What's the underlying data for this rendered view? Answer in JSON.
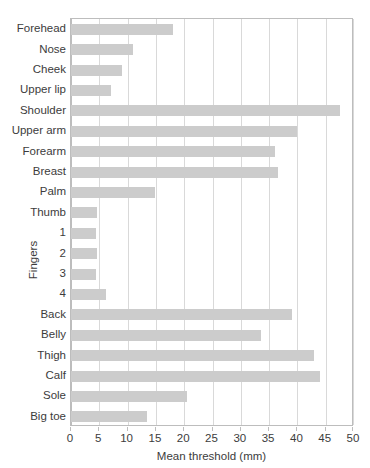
{
  "chart_data": {
    "type": "bar",
    "orientation": "horizontal",
    "title": "",
    "xlabel": "Mean threshold (mm)",
    "ylabel": "",
    "xlim": [
      0,
      50
    ],
    "xticks": [
      0,
      5,
      10,
      15,
      20,
      25,
      30,
      35,
      40,
      45,
      50
    ],
    "grid": true,
    "legend": null,
    "bar_color": "#cccccc",
    "group_labels": [
      {
        "label": "Fingers",
        "members": [
          "1",
          "2",
          "3",
          "4"
        ]
      }
    ],
    "categories": [
      "Forehead",
      "Nose",
      "Cheek",
      "Upper lip",
      "Shoulder",
      "Upper arm",
      "Forearm",
      "Breast",
      "Palm",
      "Thumb",
      "1",
      "2",
      "3",
      "4",
      "Back",
      "Belly",
      "Thigh",
      "Calf",
      "Sole",
      "Big toe"
    ],
    "values": [
      18.0,
      11.0,
      9.0,
      7.0,
      47.5,
      40.0,
      36.0,
      36.5,
      14.8,
      4.6,
      4.4,
      4.6,
      4.5,
      6.2,
      39.0,
      33.5,
      43.0,
      44.0,
      20.5,
      13.5
    ]
  }
}
